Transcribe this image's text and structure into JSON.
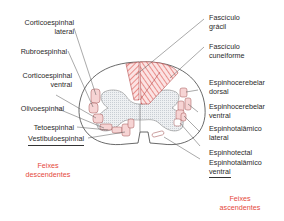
{
  "diagram": {
    "descending": {
      "group_label_line1": "Feixes",
      "group_label_line2": "descendentes",
      "tracts": [
        {
          "line1": "Corticoespinhal",
          "line2": "lateral"
        },
        {
          "line1": "Rubroespinhal",
          "line2": ""
        },
        {
          "line1": "Corticoespinhal",
          "line2": "ventral"
        },
        {
          "line1": "Olivoespinhal",
          "line2": ""
        },
        {
          "line1": "Tetoespinhal",
          "line2": ""
        },
        {
          "line1": "Vestibuloespinhal",
          "line2": ""
        }
      ]
    },
    "ascending": {
      "group_label_line1": "Feixes",
      "group_label_line2": "ascendentes",
      "tracts": [
        {
          "line1": "Fascículo",
          "line2": "grácil"
        },
        {
          "line1": "Fascículo",
          "line2": "cuneiforme"
        },
        {
          "line1": "Espinhocerebelar",
          "line2": "dorsal"
        },
        {
          "line1": "Espinhocerebelar",
          "line2": "ventral"
        },
        {
          "line1": "Espinhotalâmico",
          "line2": "lateral"
        },
        {
          "line1": "Espinhotectal",
          "line2": ""
        },
        {
          "line1": "Espinhotalâmico",
          "line2": "ventral"
        }
      ]
    },
    "colors": {
      "tract_fill": "#f6d4d4",
      "hatch": "#e0605a",
      "grey_matter": "#e6e9ec",
      "outline": "#444444",
      "group_label": "#e5493a"
    }
  }
}
